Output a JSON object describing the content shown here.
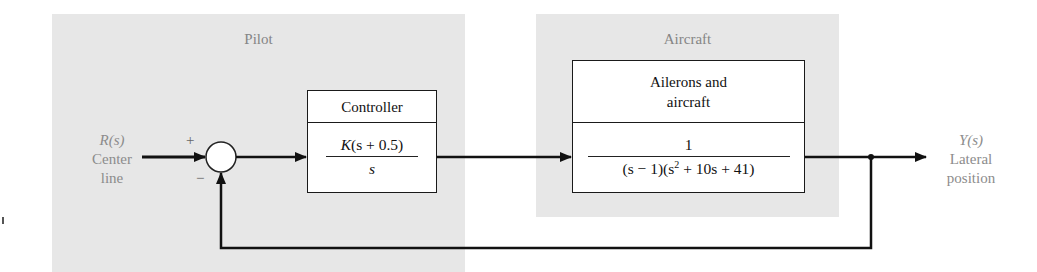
{
  "diagram": {
    "type": "feedback-control-block-diagram",
    "regions": {
      "pilot": {
        "label": "Pilot"
      },
      "aircraft": {
        "label": "Aircraft"
      }
    },
    "input": {
      "symbol": "R(s)",
      "line1": "Center",
      "line2": "line"
    },
    "output": {
      "symbol": "Y(s)",
      "line1": "Lateral",
      "line2": "position"
    },
    "summing_junction": {
      "plus_sign": "+",
      "minus_sign": "−"
    },
    "blocks": {
      "controller": {
        "title": "Controller",
        "numerator_K": "K",
        "numerator_rest": "(s + 0.5)",
        "denominator": "s"
      },
      "plant": {
        "title_line1": "Ailerons and",
        "title_line2": "aircraft",
        "numerator": "1",
        "denominator_part1": "(s − 1)(s",
        "denominator_exp": "2",
        "denominator_part2": " + 10s + 41)"
      }
    },
    "feedback": "unity negative feedback",
    "colors": {
      "region_bg": "#e7e7e7",
      "label_gray": "#8c8c8c",
      "line": "#111111"
    }
  }
}
